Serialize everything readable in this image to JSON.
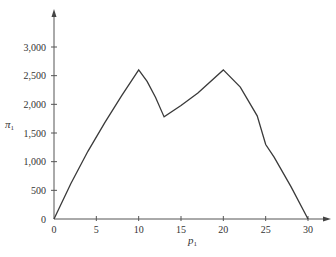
{
  "chart_data": {
    "type": "line",
    "title": "",
    "xlabel": "p1",
    "ylabel": "π1",
    "xlim": [
      0,
      31.5
    ],
    "ylim": [
      0,
      3300
    ],
    "grid": false,
    "legend": null,
    "x_ticks": [
      0,
      5,
      10,
      15,
      20,
      25,
      30
    ],
    "y_ticks": [
      0,
      500,
      1000,
      1500,
      2000,
      2500,
      3000
    ],
    "x_tick_labels": [
      "0",
      "5",
      "10",
      "15",
      "20",
      "25",
      "30"
    ],
    "y_tick_labels": [
      "0",
      "500",
      "1,000",
      "1,500",
      "2,000",
      "2,500",
      "3,000"
    ],
    "series": [
      {
        "name": "π1",
        "x": [
          0,
          2,
          4,
          6,
          8,
          10,
          11,
          12,
          13,
          15,
          17,
          20,
          22,
          24,
          25,
          26,
          28,
          30
        ],
        "y": [
          0,
          620,
          1180,
          1680,
          2150,
          2600,
          2400,
          2120,
          1780,
          1980,
          2200,
          2600,
          2300,
          1800,
          1300,
          1080,
          560,
          0
        ]
      }
    ]
  },
  "labels": {
    "y_axis": "π",
    "y_axis_sub": "1",
    "x_axis": "p",
    "x_axis_sub": "1"
  }
}
